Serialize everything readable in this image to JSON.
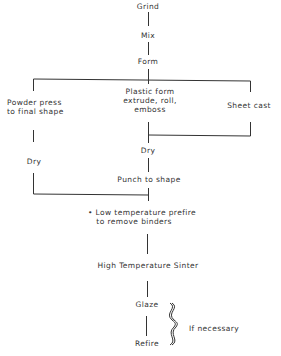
{
  "diagram": {
    "type": "process-flowchart",
    "nodes": {
      "grind": "Grind",
      "mix": "Mix",
      "form": "Form",
      "powder_press": "Powder press\nto final shape",
      "plastic_form": "Plastic form\nextrude, roll,\nemboss",
      "sheet_cast": "Sheet cast",
      "dry_left": "Dry",
      "dry_center": "Dry",
      "punch": "Punch to shape",
      "prefire": "• Low temperature prefire\n   to remove binders",
      "sinter": "High Temperature Sinter",
      "glaze": "Glaze",
      "refire": "Refire"
    },
    "annotations": {
      "if_necessary": "If necessary"
    },
    "edges": [
      [
        "grind",
        "mix"
      ],
      [
        "mix",
        "form"
      ],
      [
        "form",
        "powder_press"
      ],
      [
        "form",
        "plastic_form"
      ],
      [
        "form",
        "sheet_cast"
      ],
      [
        "powder_press",
        "dry_left"
      ],
      [
        "plastic_form",
        "dry_center"
      ],
      [
        "sheet_cast",
        "dry_center"
      ],
      [
        "dry_center",
        "punch"
      ],
      [
        "dry_left",
        "prefire"
      ],
      [
        "punch",
        "prefire"
      ],
      [
        "prefire",
        "sinter"
      ],
      [
        "sinter",
        "glaze"
      ],
      [
        "glaze",
        "refire"
      ]
    ],
    "colors": {
      "line": "#333333",
      "text": "#333333",
      "background": "#ffffff"
    }
  }
}
